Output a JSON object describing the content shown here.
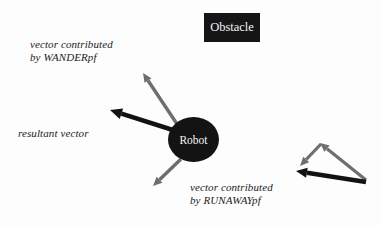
{
  "figure": {
    "type": "diagram",
    "background_color": "#fdfdfd"
  },
  "obstacle": {
    "label": "Obstacle",
    "fill_color": "#151515",
    "text_color": "#f2f2f2",
    "x": 204,
    "y": 13,
    "width": 56,
    "height": 29
  },
  "robot": {
    "label": "Robot",
    "fill_color": "#131313",
    "text_color": "#f4f4f4",
    "cx": 193,
    "cy": 139,
    "rx": 25,
    "ry": 22
  },
  "labels": {
    "wander": {
      "line1": "vector contributed",
      "line2": "by WANDERpf"
    },
    "resultant": {
      "line1": "resultant vector"
    },
    "runaway": {
      "line1": "vector contributed",
      "line2": "by RUNAWAYpf"
    }
  },
  "colors": {
    "gray_vector": "#6e6e6e",
    "black_vector": "#121212",
    "text": "#1c1c1c"
  },
  "vectors": [
    {
      "name": "wander-contribution",
      "style": "gray",
      "from": [
        177,
        124
      ],
      "to": [
        143,
        73
      ],
      "width": 3.4,
      "head": 9
    },
    {
      "name": "resultant-vector",
      "style": "black",
      "from": [
        176,
        131
      ],
      "to": [
        110,
        110
      ],
      "width": 4.6,
      "head": 12
    },
    {
      "name": "runaway-contribution",
      "style": "gray",
      "from": [
        181,
        159
      ],
      "to": [
        153,
        186
      ],
      "width": 3.4,
      "head": 9
    },
    {
      "name": "runaway-field-vector",
      "style": "gray",
      "from": [
        366,
        180
      ],
      "to": [
        320,
        143
      ],
      "width": 3.2,
      "head": 9
    },
    {
      "name": "obstacle-repulsion-vector",
      "style": "gray",
      "from": [
        321,
        144
      ],
      "to": [
        300,
        166
      ],
      "width": 3.2,
      "head": 9
    },
    {
      "name": "runaway-resultant-vector",
      "style": "black",
      "from": [
        366,
        182
      ],
      "to": [
        296,
        171
      ],
      "width": 4.4,
      "head": 11
    }
  ]
}
